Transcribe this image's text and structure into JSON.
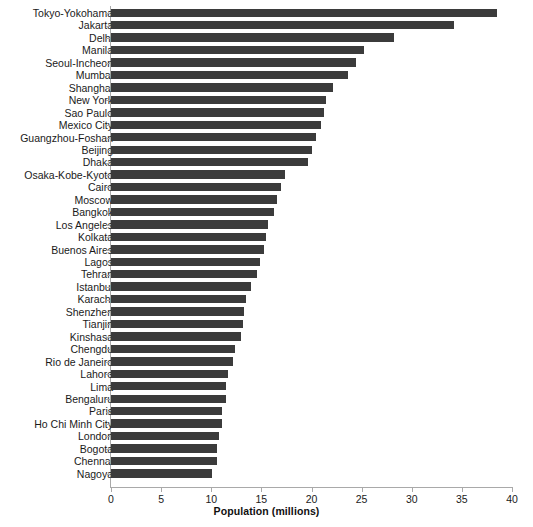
{
  "chart_data": {
    "type": "bar",
    "orientation": "horizontal",
    "title": "",
    "xlabel": "Population (millions)",
    "ylabel": "",
    "xlim": [
      0,
      40
    ],
    "xticks": [
      0,
      5,
      10,
      15,
      20,
      25,
      30,
      35,
      40
    ],
    "grid": false,
    "legend": null,
    "bar_color": "#3b3b3b",
    "axis_color": "#a9a9a9",
    "categories": [
      "Tokyo-Yokohama",
      "Jakarta",
      "Delhi",
      "Manila",
      "Seoul-Incheon",
      "Mumbai",
      "Shanghai",
      "New York",
      "Sao Paulo",
      "Mexico City",
      "Guangzhou-Foshan",
      "Beijing",
      "Dhaka",
      "Osaka-Kobe-Kyoto",
      "Cairo",
      "Moscow",
      "Bangkok",
      "Los Angeles",
      "Kolkata",
      "Buenos Aires",
      "Lagos",
      "Tehran",
      "Istanbul",
      "Karachi",
      "Shenzhen",
      "Tianjin",
      "Kinshasa",
      "Chengdu",
      "Rio de Janeiro",
      "Lahore",
      "Lima",
      "Bengaluru",
      "Paris",
      "Ho Chi Minh City",
      "London",
      "Bogota",
      "Chennai",
      "Nagoya"
    ],
    "values": [
      38.5,
      34.2,
      28.2,
      25.2,
      24.4,
      23.6,
      22.1,
      21.4,
      21.2,
      20.9,
      20.4,
      20.0,
      19.7,
      17.4,
      17.0,
      16.6,
      16.3,
      15.7,
      15.5,
      15.3,
      14.9,
      14.6,
      14.0,
      13.5,
      13.3,
      13.2,
      13.0,
      12.4,
      12.2,
      11.7,
      11.5,
      11.5,
      11.1,
      11.1,
      10.8,
      10.6,
      10.6,
      10.1
    ]
  }
}
